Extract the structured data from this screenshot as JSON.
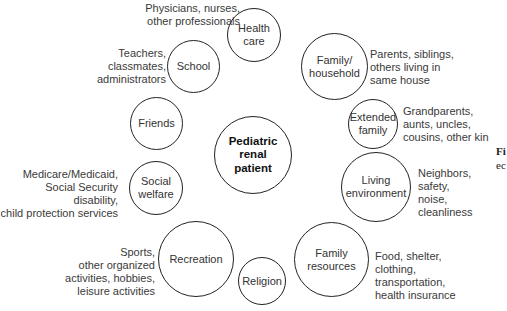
{
  "diagram": {
    "center": {
      "label": "Pediatric\nrenal\npatient"
    },
    "nodes": [
      {
        "id": "health-care",
        "label": "Health\ncare",
        "note": "Physicians, nurses,\nother professionals"
      },
      {
        "id": "school",
        "label": "School",
        "note": "Teachers,\nclassmates,\nadministrators"
      },
      {
        "id": "family-household",
        "label": "Family/\nhousehold",
        "note": "Parents, siblings,\nothers living in\nsame house"
      },
      {
        "id": "friends",
        "label": "Friends",
        "note": ""
      },
      {
        "id": "extended-family",
        "label": "Extended\nfamily",
        "note": "Grandparents,\naunts, uncles,\ncousins, other kin"
      },
      {
        "id": "social-welfare",
        "label": "Social\nwelfare",
        "note": "Medicare/Medicaid,\nSocial Security disability,\nchild protection services"
      },
      {
        "id": "living-environment",
        "label": "Living\nenvironment",
        "note": "Neighbors,\nsafety,\nnoise,\ncleanliness"
      },
      {
        "id": "recreation",
        "label": "Recreation",
        "note": "Sports,\nother organized\nactivities, hobbies,\nleisure activities"
      },
      {
        "id": "family-resources",
        "label": "Family\nresources",
        "note": "Food, shelter,\nclothing,\ntransportation,\nhealth insurance"
      },
      {
        "id": "religion",
        "label": "Religion",
        "note": ""
      }
    ]
  },
  "caption": {
    "line1": "Fi",
    "line2": "ec"
  }
}
